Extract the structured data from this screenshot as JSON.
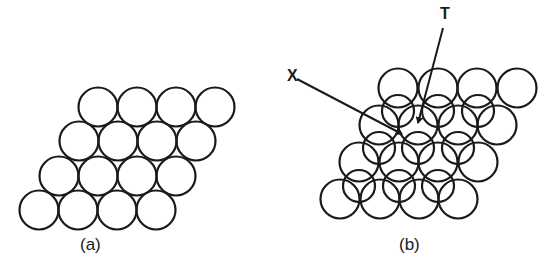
{
  "figure": {
    "panels": [
      {
        "id": "a",
        "caption": "(a)",
        "layers": [
          {
            "name": "single-layer",
            "radius": 19.5,
            "rows": [
              {
                "y": 107,
                "x": [
                  98,
                  137,
                  176,
                  215
                ]
              },
              {
                "y": 141,
                "x": [
                  79,
                  118,
                  157,
                  196
                ]
              },
              {
                "y": 176,
                "x": [
                  59,
                  98,
                  137,
                  176
                ]
              },
              {
                "y": 210,
                "x": [
                  39,
                  78,
                  117,
                  156
                ]
              }
            ]
          }
        ]
      },
      {
        "id": "b",
        "caption": "(b)",
        "layers": [
          {
            "name": "bottom-layer",
            "radius": 19.5,
            "rows": [
              {
                "y": 88,
                "x": [
                  398,
                  438,
                  477,
                  517
                ]
              },
              {
                "y": 125,
                "x": [
                  379,
                  418,
                  458,
                  497
                ]
              },
              {
                "y": 162,
                "x": [
                  359,
                  399,
                  438,
                  478
                ]
              },
              {
                "y": 199,
                "x": [
                  340,
                  380,
                  419,
                  458
                ]
              }
            ]
          },
          {
            "name": "top-layer",
            "radius": 16,
            "rows": [
              {
                "y": 111,
                "x": [
                  398,
                  438,
                  478
                ]
              },
              {
                "y": 148,
                "x": [
                  379,
                  418,
                  458
                ]
              },
              {
                "y": 186,
                "x": [
                  359,
                  399,
                  438
                ]
              }
            ]
          }
        ],
        "annotations": [
          {
            "label": "X",
            "text_x": 287,
            "text_y": 81,
            "arrow_from": [
              297,
              79
            ],
            "arrow_to": [
              402,
              134
            ]
          },
          {
            "label": "T",
            "text_x": 440,
            "text_y": 19,
            "arrow_from": [
              443,
              28
            ],
            "arrow_to": [
              418,
              123
            ]
          }
        ]
      }
    ]
  }
}
